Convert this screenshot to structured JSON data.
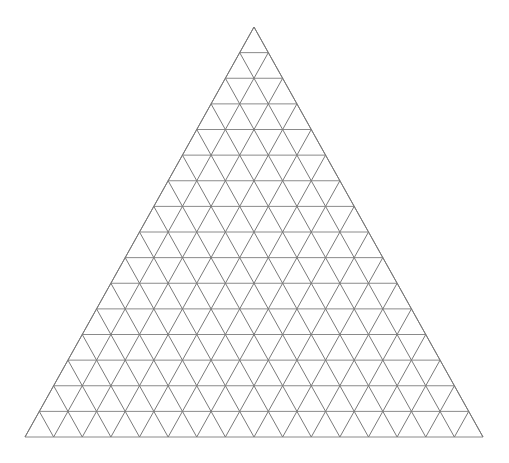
{
  "canvas": {
    "width": 509,
    "height": 463,
    "background_color": "#ffffff"
  },
  "figure": {
    "name": "triangular-grid",
    "title": ""
  },
  "chart_data": {
    "type": "diagram",
    "subtype": "triangular-lattice",
    "title": "",
    "subtitle": "",
    "xlabel": "",
    "ylabel": "",
    "grid": true,
    "legend": null,
    "annotations": [],
    "subdivisions": 16,
    "apex": {
      "x": 254,
      "y": 27
    },
    "base_left": {
      "x": 25,
      "y": 437
    },
    "base_right": {
      "x": 483,
      "y": 437
    },
    "base_width": 458,
    "height": 410,
    "row_height": 25.625,
    "cell_base": 28.625,
    "counts": {
      "rows": 16,
      "upward_triangles": 256,
      "downward_triangles": 225,
      "total_small_triangles": 481,
      "lattice_points": 153,
      "horizontal_lines": 16,
      "left_diagonal_lines": 16,
      "right_diagonal_lines": 16
    },
    "style": {
      "line_color": "#808080",
      "horizontal_line_color": "#8a8a8a",
      "diagonal_line_color": "#7a7a7a",
      "line_width": 1,
      "fill": "none",
      "background": "#ffffff"
    }
  }
}
